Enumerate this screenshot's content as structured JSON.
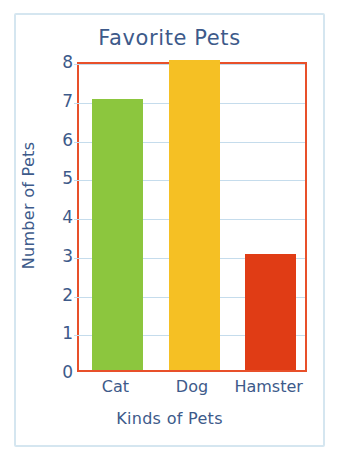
{
  "chart_data": {
    "type": "bar",
    "title": "Favorite Pets",
    "xlabel": "Kinds of Pets",
    "ylabel": "Number of Pets",
    "categories": [
      "Cat",
      "Dog",
      "Hamster"
    ],
    "values": [
      7,
      8,
      3
    ],
    "bar_colors": [
      "#8CC63E",
      "#F5C024",
      "#E03C15"
    ],
    "ylim": [
      0,
      8
    ],
    "ytick_labels": [
      "0",
      "1",
      "2",
      "3",
      "4",
      "5",
      "6",
      "7",
      "8"
    ],
    "ytick_values": [
      0,
      1,
      2,
      3,
      4,
      5,
      6,
      7,
      8
    ],
    "grid": true,
    "grid_color": "#C5DCEC",
    "legend": false,
    "series": [
      {
        "name": "Number of Pets",
        "points": [
          {
            "category": "Cat",
            "value": 7,
            "color": "#8CC63E"
          },
          {
            "category": "Dog",
            "value": 8,
            "color": "#F5C024"
          },
          {
            "category": "Hamster",
            "value": 3,
            "color": "#E03C15"
          }
        ]
      }
    ]
  },
  "style": {
    "text_color": "#3D5A8A",
    "plot_border_color": "#E8502A",
    "outer_frame_color": "#D5E6F0",
    "background": "#FFFFFF"
  }
}
